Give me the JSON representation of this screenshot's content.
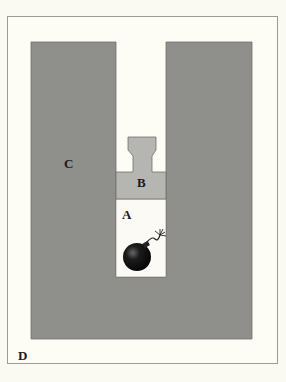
{
  "diagram": {
    "type": "bomb-in-shaft illustration",
    "labels": {
      "A": "A",
      "B": "B",
      "C": "C",
      "D": "D"
    },
    "regions": {
      "A": "white shaft cavity containing bomb",
      "B": "light gray plug / stemming",
      "C": "dark gray surrounding material",
      "D": "outer frame area"
    },
    "colors": {
      "background": "#fdfcf5",
      "frame_border": "#9a9a96",
      "material_c": "#8f8f8c",
      "plug_b": "#b5b5b1",
      "shaft_a": "#fbfaf4",
      "bomb": "#111111"
    },
    "icons": {
      "bomb": "bomb-icon"
    }
  }
}
